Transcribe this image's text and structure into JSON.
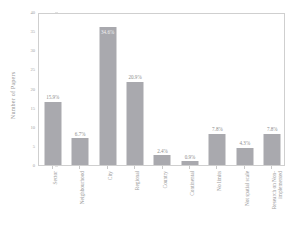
{
  "chart_data": {
    "type": "bar",
    "title": "",
    "xlabel": "",
    "ylabel": "Number of Papers",
    "ylim": [
      0,
      40
    ],
    "yticks": [
      0,
      5,
      10,
      15,
      20,
      25,
      30,
      35,
      40
    ],
    "ytick_labels": [
      "0",
      "5",
      "10",
      "15",
      "20",
      "25",
      "30",
      "35",
      "40"
    ],
    "grid": false,
    "legend": false,
    "bar_color": "#a9a9ae",
    "categories": [
      "Sector",
      "Neighbourhood",
      "City",
      "Regional",
      "Country",
      "Continental",
      "No limits",
      "Not spatial scale",
      "Research on Non-implemented"
    ],
    "category_lines": [
      [
        "Sector"
      ],
      [
        "Neighbourhood"
      ],
      [
        "City"
      ],
      [
        "Regional"
      ],
      [
        "Country"
      ],
      [
        "Continental"
      ],
      [
        "No limits"
      ],
      [
        "Not spatial scale"
      ],
      [
        "Research on Non-",
        "implemented"
      ]
    ],
    "values": [
      16.5,
      7.0,
      36.0,
      21.7,
      2.5,
      1.0,
      8.1,
      4.5,
      8.1
    ],
    "data_labels": [
      "15.9%",
      "6.7%",
      "34.6%",
      "20.9%",
      "2.4%",
      "0.9%",
      "7.8%",
      "4.3%",
      "7.8%"
    ],
    "label_placement": [
      "outside",
      "outside",
      "inside",
      "outside",
      "outside",
      "outside",
      "outside",
      "outside",
      "outside"
    ]
  }
}
